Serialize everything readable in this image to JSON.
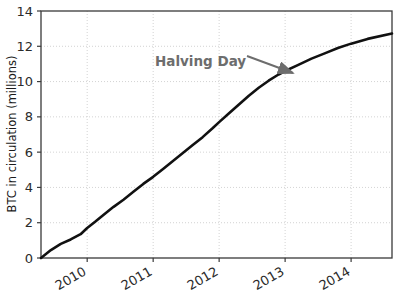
{
  "chart_data": {
    "type": "line",
    "title": "",
    "xlabel": "",
    "ylabel": "BTC in circulation (millions)",
    "xlim": [
      2009.3,
      2014.62
    ],
    "ylim": [
      0,
      14
    ],
    "grid": true,
    "legend": null,
    "xticks": [
      {
        "value": 2010,
        "label": "2010"
      },
      {
        "value": 2011,
        "label": "2011"
      },
      {
        "value": 2012,
        "label": "2012"
      },
      {
        "value": 2013,
        "label": "2013"
      },
      {
        "value": 2014,
        "label": "2014"
      }
    ],
    "yticks": [
      {
        "value": 0,
        "label": "0"
      },
      {
        "value": 2,
        "label": "2"
      },
      {
        "value": 4,
        "label": "4"
      },
      {
        "value": 6,
        "label": "6"
      },
      {
        "value": 8,
        "label": "8"
      },
      {
        "value": 10,
        "label": "10"
      },
      {
        "value": 12,
        "label": "12"
      },
      {
        "value": 14,
        "label": "14"
      }
    ],
    "series": [
      {
        "name": "BTC in circulation",
        "color": "#111111",
        "x": [
          2009.3,
          2009.45,
          2009.6,
          2009.75,
          2009.9,
          2010.0,
          2010.12,
          2010.25,
          2010.4,
          2010.55,
          2010.7,
          2010.85,
          2011.0,
          2011.15,
          2011.3,
          2011.45,
          2011.6,
          2011.75,
          2011.9,
          2012.0,
          2012.15,
          2012.3,
          2012.45,
          2012.6,
          2012.75,
          2012.9,
          2013.0,
          2013.2,
          2013.4,
          2013.6,
          2013.8,
          2014.0,
          2014.25,
          2014.62
        ],
        "y": [
          0.0,
          0.45,
          0.8,
          1.05,
          1.35,
          1.7,
          2.05,
          2.45,
          2.9,
          3.3,
          3.75,
          4.2,
          4.6,
          5.05,
          5.5,
          5.95,
          6.4,
          6.85,
          7.35,
          7.7,
          8.2,
          8.7,
          9.2,
          9.65,
          10.05,
          10.4,
          10.6,
          10.95,
          11.3,
          11.6,
          11.9,
          12.15,
          12.42,
          12.72
        ]
      }
    ],
    "annotations": [
      {
        "name": "halving-day",
        "text": "Halving Day",
        "text_x": 155,
        "text_y": 66,
        "arrow_from_x": 247,
        "arrow_from_y": 56,
        "arrow_to_x": 293,
        "arrow_to_y": 73,
        "color": "#6d6d6d"
      }
    ]
  },
  "axes": {
    "frame_color": "#3a3a3a",
    "grid_color": "#c8c8c8",
    "background": "#ffffff"
  }
}
